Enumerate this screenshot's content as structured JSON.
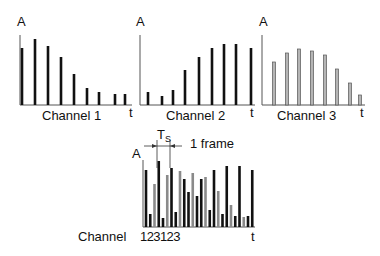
{
  "diagram": {
    "axis_label_y": "A",
    "axis_label_x": "t",
    "channels": [
      {
        "name": "Channel 1",
        "style": "black",
        "heights": [
          57,
          66,
          59,
          48,
          31,
          17,
          13,
          11,
          11
        ]
      },
      {
        "name": "Channel 2",
        "style": "black",
        "heights": [
          13,
          9,
          15,
          35,
          48,
          57,
          61,
          61,
          57
        ]
      },
      {
        "name": "Channel 3",
        "style": "gray-outline",
        "heights": [
          43,
          52,
          56,
          54,
          50,
          36,
          22,
          10
        ]
      }
    ],
    "multiplexed": {
      "channel_label": "Channel",
      "sequence_label": "123123",
      "ts_label": "T",
      "ts_sub": "S",
      "frame_label": "1 frame",
      "bars": [
        {
          "ch": 1,
          "h": 57
        },
        {
          "ch": 2,
          "h": 13
        },
        {
          "ch": 3,
          "h": 43
        },
        {
          "ch": 1,
          "h": 66
        },
        {
          "ch": 2,
          "h": 9
        },
        {
          "ch": 3,
          "h": 52
        },
        {
          "ch": 1,
          "h": 59
        },
        {
          "ch": 2,
          "h": 15
        },
        {
          "ch": 3,
          "h": 56
        },
        {
          "ch": 1,
          "h": 48
        },
        {
          "ch": 2,
          "h": 35
        },
        {
          "ch": 3,
          "h": 54
        },
        {
          "ch": 1,
          "h": 31
        },
        {
          "ch": 2,
          "h": 48
        },
        {
          "ch": 3,
          "h": 50
        },
        {
          "ch": 1,
          "h": 17
        },
        {
          "ch": 2,
          "h": 57
        },
        {
          "ch": 3,
          "h": 36
        },
        {
          "ch": 1,
          "h": 13
        },
        {
          "ch": 2,
          "h": 61
        },
        {
          "ch": 3,
          "h": 22
        },
        {
          "ch": 1,
          "h": 11
        },
        {
          "ch": 2,
          "h": 61
        },
        {
          "ch": 3,
          "h": 10
        },
        {
          "ch": 1,
          "h": 11
        },
        {
          "ch": 2,
          "h": 57
        }
      ]
    },
    "colors": {
      "black": "#111111",
      "gray": "#8a8a8a",
      "axis": "#555555"
    }
  }
}
